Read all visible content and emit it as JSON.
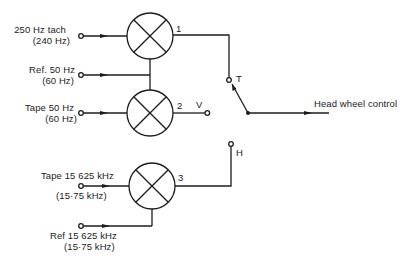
{
  "diagram": {
    "inputs": {
      "tach": {
        "line1": "250 Hz tach",
        "line2": "(240 Hz)"
      },
      "ref50": {
        "line1": "Ref. 50 Hz",
        "line2": "(60 Hz)"
      },
      "tape50": {
        "line1": "Tape 50 Hz",
        "line2": "(60 Hz)"
      },
      "tape15": {
        "line1": "Tape 15 625 kHz",
        "line2": "(15·75 kHz)"
      },
      "ref15": {
        "line1": "Ref 15 625 kHz",
        "line2": "(15·75 kHz)"
      }
    },
    "comparators": [
      {
        "id": "1",
        "label": "1"
      },
      {
        "id": "2",
        "label": "2"
      },
      {
        "id": "3",
        "label": "3"
      }
    ],
    "terminals": {
      "v": "V",
      "t": "T",
      "h": "H"
    },
    "output": {
      "label": "Head wheel control"
    },
    "colors": {
      "stroke": "#1c1c1c",
      "background": "#ffffff"
    }
  }
}
